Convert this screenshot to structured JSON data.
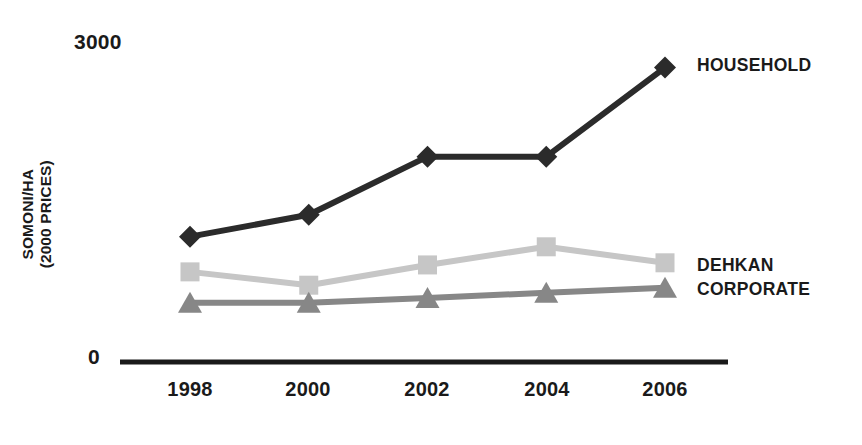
{
  "chart_data": {
    "type": "line",
    "title": "",
    "xlabel": "",
    "ylabel": "SOMONI/HA\n(2000 PRICES)",
    "categories": [
      "1998",
      "2000",
      "2002",
      "2004",
      "2006"
    ],
    "x": [
      1998,
      2000,
      2002,
      2004,
      2006
    ],
    "ylim": [
      0,
      3000
    ],
    "y_ticks": [
      "0",
      "3000"
    ],
    "y_tick_values": [
      0,
      3000
    ],
    "grid": false,
    "legend_position": "right-of-line-ends",
    "series": [
      {
        "name": "HOUSEHOLD",
        "marker": "diamond",
        "color": "#2b2b2b",
        "values": [
          1175,
          1380,
          1925,
          1925,
          2760
        ]
      },
      {
        "name": "DEHKAN",
        "marker": "square",
        "color": "#c6c6c6",
        "values": [
          845,
          720,
          910,
          1080,
          930
        ]
      },
      {
        "name": "CORPORATE",
        "marker": "triangle",
        "color": "#878787",
        "values": [
          555,
          555,
          600,
          650,
          695
        ]
      }
    ]
  },
  "axis": {
    "max_label": "3000",
    "zero_label": "0",
    "y_title": "SOMONI/HA\n(2000 PRICES)",
    "axis_color": "#1a1a1a"
  },
  "x_ticks": [
    {
      "label": "1998"
    },
    {
      "label": "2000"
    },
    {
      "label": "2002"
    },
    {
      "label": "2004"
    },
    {
      "label": "2006"
    }
  ],
  "series_labels": {
    "household": "HOUSEHOLD",
    "dehkan": "DEHKAN",
    "corporate": "CORPORATE"
  }
}
